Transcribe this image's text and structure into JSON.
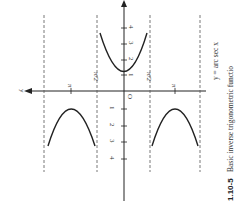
{
  "figure": {
    "function_label": "y = arc sec x",
    "caption_number": "1.10-5",
    "caption_text": "Basic inverse trigonometric functio",
    "axis_y_label": "y",
    "origin_label": "O",
    "x_ticks": [
      "1",
      "2",
      "3",
      "4"
    ],
    "x_ticks_neg": [
      "1",
      "2",
      "3",
      "4"
    ],
    "y_tick_labels": [
      "π/2",
      "π",
      "π/2",
      "π"
    ]
  }
}
